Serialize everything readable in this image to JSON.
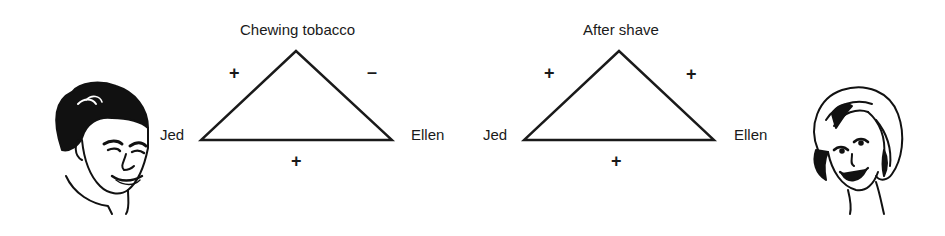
{
  "diagram": {
    "type": "balance-theory-triads",
    "triads": [
      {
        "object": "Chewing tobacco",
        "person_left": "Jed",
        "person_right": "Ellen",
        "relations": {
          "jed_to_object": "+",
          "ellen_to_object": "–",
          "jed_to_ellen": "+"
        }
      },
      {
        "object": "After shave",
        "person_left": "Jed",
        "person_right": "Ellen",
        "relations": {
          "jed_to_object": "+",
          "ellen_to_object": "+",
          "jed_to_ellen": "+"
        }
      }
    ],
    "illustrations": {
      "left": "man-face-drawing",
      "right": "woman-face-drawing"
    },
    "colors": {
      "ink": "#1a1a1a",
      "background": "#ffffff"
    }
  }
}
